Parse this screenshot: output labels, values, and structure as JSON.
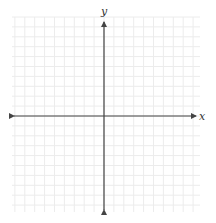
{
  "diagram": {
    "type": "coordinate-plane",
    "x_axis_label": "x",
    "y_axis_label": "y",
    "grid": {
      "left": 12,
      "top": 17,
      "right": 200,
      "bottom": 212,
      "cell_size": 9.9,
      "color": "#ececec"
    },
    "origin": {
      "x": 104,
      "y": 116
    },
    "x_axis": {
      "from": 14,
      "to": 196
    },
    "y_axis": {
      "from": 22,
      "to": 210
    },
    "axis_color": "#444444"
  }
}
